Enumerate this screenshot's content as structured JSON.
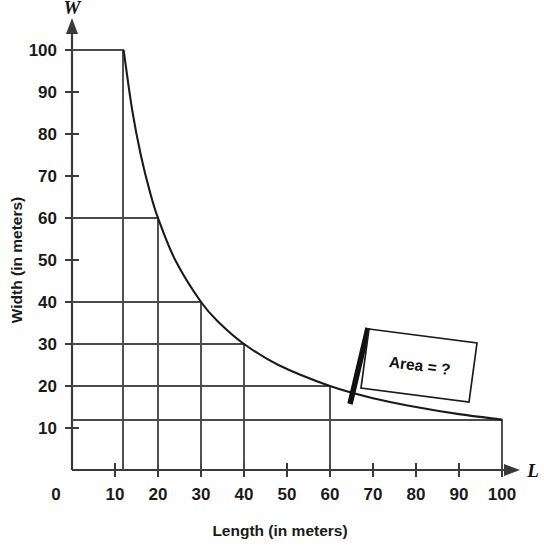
{
  "chart_data": {
    "type": "line",
    "title": "",
    "xlabel": "Length (in meters)",
    "ylabel": "Width (in meters)",
    "x_axis_symbol": "L",
    "y_axis_symbol": "W",
    "xlim": [
      0,
      108
    ],
    "ylim": [
      0,
      106
    ],
    "grid": false,
    "relation": "L × W = 1200",
    "xticks": [
      0,
      10,
      20,
      30,
      40,
      50,
      60,
      70,
      80,
      90,
      100
    ],
    "xtick_labels": [
      "0",
      "10",
      "20",
      "30",
      "40",
      "50",
      "60",
      "70",
      "80",
      "90",
      "100"
    ],
    "yticks": [
      10,
      20,
      30,
      40,
      50,
      60,
      70,
      80,
      90,
      100
    ],
    "ytick_labels": [
      "10",
      "20",
      "30",
      "40",
      "50",
      "60",
      "70",
      "80",
      "90",
      "100"
    ],
    "curve_points": [
      {
        "x": 12,
        "y": 100
      },
      {
        "x": 14,
        "y": 85.7
      },
      {
        "x": 16,
        "y": 75
      },
      {
        "x": 18,
        "y": 66.7
      },
      {
        "x": 20,
        "y": 60
      },
      {
        "x": 24,
        "y": 50
      },
      {
        "x": 30,
        "y": 40
      },
      {
        "x": 34.3,
        "y": 35
      },
      {
        "x": 40,
        "y": 30
      },
      {
        "x": 48,
        "y": 25
      },
      {
        "x": 60,
        "y": 20
      },
      {
        "x": 70,
        "y": 17.1
      },
      {
        "x": 80,
        "y": 15
      },
      {
        "x": 90,
        "y": 13.3
      },
      {
        "x": 100,
        "y": 12
      }
    ],
    "marked_rectangles": [
      {
        "length": 12,
        "width": 100
      },
      {
        "length": 20,
        "width": 60
      },
      {
        "length": 30,
        "width": 40
      },
      {
        "length": 40,
        "width": 30
      },
      {
        "length": 60,
        "width": 20
      },
      {
        "length": 100,
        "width": 12
      }
    ],
    "annotations": [
      {
        "name": "area-callout",
        "text": "Area = ?",
        "points_to": {
          "x": 67,
          "y": 18
        }
      }
    ],
    "legend": null
  },
  "callout": {
    "label": "Area = ?"
  },
  "axes": {
    "x_symbol": "L",
    "y_symbol": "W",
    "x_title": "Length (in meters)",
    "y_title": "Width (in meters)"
  }
}
